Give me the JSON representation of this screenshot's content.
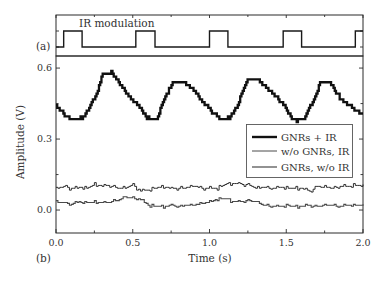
{
  "figure": {
    "panel_a_label": "(a)",
    "panel_b_label": "(b)",
    "ir_label": "IR modulation",
    "xlabel": "Time (s)",
    "ylabel": "Amplitude (V)"
  },
  "legend": {
    "items": [
      {
        "label": "GNRs + IR",
        "series": "gnrs_ir"
      },
      {
        "label": "w/o GNRs, IR",
        "series": "wo_gnrs_ir"
      },
      {
        "label": "GNRs, w/o IR",
        "series": "gnrs_wo_ir"
      }
    ]
  },
  "colors": {
    "axis": "#2a2a2a",
    "text": "#333333",
    "gnrs_ir": "#111111",
    "wo_gnrs_ir": "#1c1c1c",
    "gnrs_wo_ir": "#4a4a4a"
  },
  "chart_data": {
    "type": "line",
    "title": "",
    "xlabel": "Time (s)",
    "ylabel": "Amplitude (V)",
    "xlim": [
      0.0,
      2.0
    ],
    "ylim": [
      -0.097,
      0.651
    ],
    "xticks": [
      0.0,
      0.5,
      1.0,
      1.5,
      2.0
    ],
    "xtick_labels": [
      "0.0",
      "0.5",
      "1.0",
      "1.5",
      "2.0"
    ],
    "xminor": [
      0.25,
      0.75,
      1.25,
      1.75
    ],
    "yticks": [
      0.0,
      0.3,
      0.6
    ],
    "ytick_labels": [
      "0.0",
      "0.3",
      "0.6"
    ],
    "yminor": [
      0.15,
      0.45
    ],
    "grid": false,
    "legend_position": "center-right (inside panel b)",
    "panels": [
      {
        "id": "a",
        "label": "(a)",
        "annotation": "IR modulation",
        "type": "step",
        "levels": {
          "off": 0,
          "on": 1
        },
        "ir_on_intervals": [
          [
            0.05,
            0.17
          ],
          [
            0.52,
            0.645
          ],
          [
            1.0,
            1.12
          ],
          [
            1.48,
            1.6
          ],
          [
            1.95,
            2.0
          ]
        ]
      },
      {
        "id": "b",
        "label": "(b)",
        "series": [
          {
            "key": "gnrs_ir",
            "name": "GNRs + IR",
            "x": [
              0,
              0.04,
              0.08,
              0.14,
              0.19,
              0.23,
              0.27,
              0.3,
              0.36,
              0.4,
              0.44,
              0.5,
              0.55,
              0.59,
              0.63,
              0.66,
              0.69,
              0.72,
              0.76,
              0.83,
              0.89,
              0.95,
              1.0,
              1.02,
              1.08,
              1.13,
              1.19,
              1.22,
              1.25,
              1.31,
              1.35,
              1.41,
              1.46,
              1.5,
              1.54,
              1.61,
              1.64,
              1.69,
              1.72,
              1.79,
              1.82,
              1.87,
              1.93,
              1.98,
              2.0
            ],
            "y": [
              0.44,
              0.41,
              0.39,
              0.38,
              0.4,
              0.45,
              0.5,
              0.57,
              0.58,
              0.55,
              0.51,
              0.46,
              0.43,
              0.39,
              0.38,
              0.39,
              0.45,
              0.49,
              0.54,
              0.54,
              0.51,
              0.46,
              0.43,
              0.41,
              0.38,
              0.39,
              0.45,
              0.51,
              0.55,
              0.55,
              0.53,
              0.49,
              0.46,
              0.43,
              0.38,
              0.38,
              0.42,
              0.48,
              0.54,
              0.54,
              0.5,
              0.46,
              0.43,
              0.41,
              0.4
            ]
          },
          {
            "key": "wo_gnrs_ir",
            "name": "w/o GNRs, IR",
            "x": [
              0,
              0.05,
              0.1,
              0.15,
              0.2,
              0.25,
              0.3,
              0.35,
              0.4,
              0.45,
              0.5,
              0.55,
              0.6,
              0.65,
              0.7,
              0.75,
              0.8,
              0.85,
              0.9,
              0.95,
              1.0,
              1.05,
              1.1,
              1.15,
              1.2,
              1.25,
              1.3,
              1.35,
              1.4,
              1.45,
              1.5,
              1.55,
              1.6,
              1.65,
              1.7,
              1.75,
              1.8,
              1.85,
              1.9,
              1.95,
              2.0
            ],
            "y": [
              0.09,
              0.1,
              0.09,
              0.095,
              0.093,
              0.11,
              0.1,
              0.105,
              0.093,
              0.093,
              0.105,
              0.08,
              0.085,
              0.093,
              0.1,
              0.09,
              0.09,
              0.095,
              0.1,
              0.093,
              0.093,
              0.093,
              0.11,
              0.11,
              0.11,
              0.105,
              0.093,
              0.095,
              0.093,
              0.095,
              0.093,
              0.093,
              0.093,
              0.08,
              0.1,
              0.095,
              0.093,
              0.1,
              0.1,
              0.105,
              0.1
            ]
          },
          {
            "key": "gnrs_wo_ir",
            "name": "GNRs, w/o IR",
            "x": [
              0,
              0.05,
              0.1,
              0.15,
              0.2,
              0.25,
              0.3,
              0.35,
              0.4,
              0.45,
              0.5,
              0.55,
              0.6,
              0.65,
              0.7,
              0.75,
              0.8,
              0.85,
              0.9,
              0.95,
              1.0,
              1.05,
              1.1,
              1.15,
              1.2,
              1.25,
              1.3,
              1.35,
              1.4,
              1.45,
              1.5,
              1.55,
              1.6,
              1.65,
              1.7,
              1.75,
              1.8,
              1.85,
              1.9,
              1.95,
              2.0
            ],
            "y": [
              0.035,
              0.03,
              0.025,
              0.035,
              0.03,
              0.035,
              0.03,
              0.035,
              0.04,
              0.055,
              0.05,
              0.045,
              0.02,
              0.015,
              0.015,
              0.02,
              0.015,
              0.02,
              0.02,
              0.03,
              0.035,
              0.045,
              0.05,
              0.035,
              0.035,
              0.04,
              0.035,
              0.02,
              0.015,
              0.015,
              0.02,
              0.015,
              0.015,
              0.02,
              0.015,
              0.02,
              0.02,
              0.015,
              0.02,
              0.02,
              0.02
            ]
          }
        ]
      }
    ]
  }
}
